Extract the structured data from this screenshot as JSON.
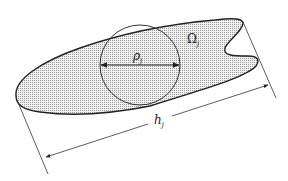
{
  "diagram": {
    "region_label": "Ω",
    "region_subscript": "j",
    "inscribed_diameter_label": "ρ",
    "inscribed_diameter_subscript": "j",
    "length_label": "h",
    "length_subscript": "j"
  },
  "colors": {
    "stroke": "#222222",
    "fill_dots": "#9a9a9a",
    "background": "#ffffff"
  }
}
